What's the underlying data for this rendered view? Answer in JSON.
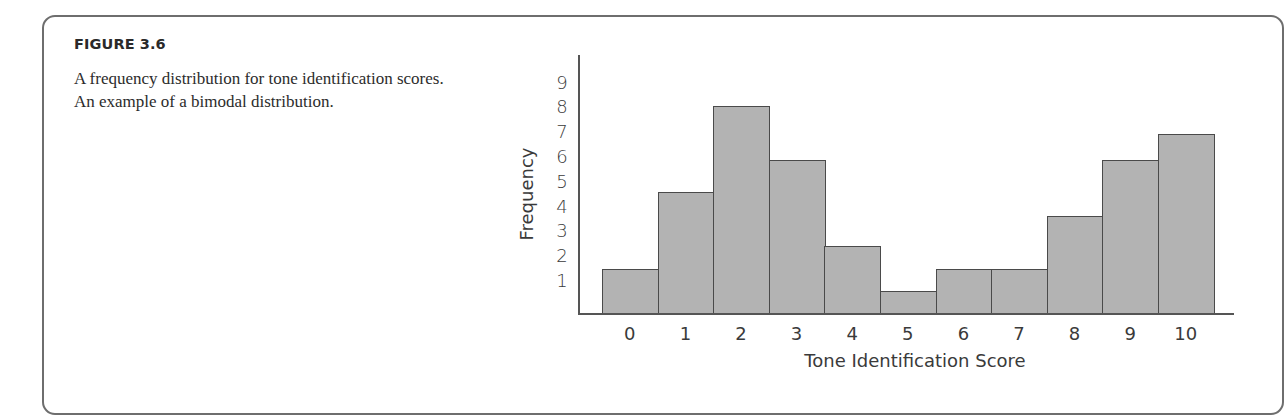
{
  "figure": {
    "label": "FIGURE 3.6",
    "caption": "A frequency distribution for tone identification scores. An example of a bimodal distribution."
  },
  "chart_data": {
    "type": "bar",
    "title": "",
    "xlabel": "Tone Identification Score",
    "ylabel": "Frequency",
    "categories": [
      "0",
      "1",
      "2",
      "3",
      "4",
      "5",
      "6",
      "7",
      "8",
      "9",
      "10"
    ],
    "values": [
      2,
      5,
      8,
      6,
      3,
      1,
      2,
      2,
      4,
      6,
      7
    ],
    "yticks": [
      "1",
      "2",
      "3",
      "4",
      "5",
      "6",
      "7",
      "8",
      "9"
    ],
    "ylim": [
      0,
      9
    ],
    "grid": false,
    "legend": null,
    "bar_color": "#b3b3b3",
    "edge_color": "#4a4a4a",
    "note": "Histogram (adjacent bars) showing a bimodal distribution"
  }
}
